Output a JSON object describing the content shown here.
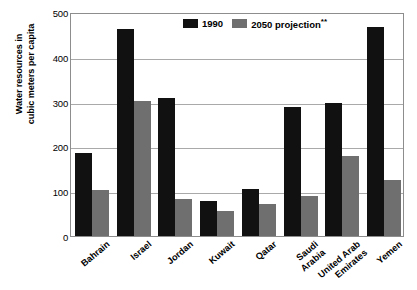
{
  "chart_data": {
    "type": "bar",
    "title": "",
    "subtitle": "",
    "xlabel": "",
    "ylabel": "Water resources in cubic meters per capita",
    "ylabel_lines": [
      "Water resources in",
      "cubic meters per capita"
    ],
    "ylim": [
      0,
      500
    ],
    "yticks": [
      0,
      100,
      200,
      300,
      400,
      500
    ],
    "ytick_labels": [
      "0",
      "100",
      "200",
      "300",
      "400",
      "500"
    ],
    "grid": true,
    "grid_axis": "y",
    "legend_position": "top-center",
    "categories": [
      "Bahrain",
      "Israel",
      "Jordan",
      "Kuwait",
      "Qatar",
      "Saudi Arabia",
      "United Arab Emirates",
      "Yemen"
    ],
    "category_label_lines": [
      [
        "Bahrain"
      ],
      [
        "Israel"
      ],
      [
        "Jordan"
      ],
      [
        "Kuwait"
      ],
      [
        "Qatar"
      ],
      [
        "Saudi",
        "Arabia"
      ],
      [
        "United Arab",
        "Emirates"
      ],
      [
        "Yemen"
      ]
    ],
    "series": [
      {
        "name": "1990",
        "color": "#111111",
        "values": [
          185,
          463,
          309,
          79,
          105,
          288,
          298,
          467
        ]
      },
      {
        "name": "2050 projection**",
        "color": "#6f6f6f",
        "values": [
          103,
          302,
          82,
          56,
          72,
          89,
          178,
          125
        ]
      }
    ],
    "annotations": [
      "**"
    ]
  },
  "legend": {
    "entries": [
      {
        "label": "1990",
        "sup": "",
        "color": "#111111"
      },
      {
        "label": "2050 projection",
        "sup": "**",
        "color": "#6f6f6f"
      }
    ]
  },
  "colors": {
    "series_1990": "#111111",
    "series_2050": "#6f6f6f",
    "axis": "#8d8d8d",
    "gridline": "#a9a9a9",
    "background": "#ffffff",
    "text": "#000000"
  }
}
